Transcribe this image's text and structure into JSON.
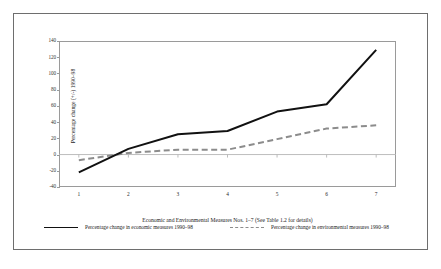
{
  "chart_data": {
    "type": "line",
    "title": "",
    "xlabel": "Economic and Environmental Measures Nos. 1–7 (See Table 1.2 for details)",
    "ylabel": "Percentage change (+/-) 1990–98",
    "x": [
      1,
      2,
      3,
      4,
      5,
      6,
      7
    ],
    "xticklabels": [
      "1",
      "2",
      "3",
      "4",
      "5",
      "6",
      "7"
    ],
    "yticklabels": [
      "140",
      "120",
      "100",
      "80",
      "60",
      "40",
      "20",
      "0",
      "-20",
      "-40"
    ],
    "yticks": [
      140,
      120,
      100,
      80,
      60,
      40,
      20,
      0,
      -20,
      -40
    ],
    "ylim": [
      -40,
      140
    ],
    "xlim": [
      0.6,
      7.4
    ],
    "grid": false,
    "legend_position": "bottom",
    "series": [
      {
        "name": "Percentage change in economic measures 1990–98",
        "values": [
          -22,
          7,
          25,
          29,
          53,
          62,
          129
        ],
        "style": "solid",
        "color": "#111111",
        "width": 2.0
      },
      {
        "name": "Percentage change in environmental measures 1990–98",
        "values": [
          -7,
          2,
          6,
          6,
          19,
          32,
          36
        ],
        "style": "dashed",
        "color": "#8c8c8c",
        "width": 2.0
      }
    ]
  },
  "legend": {
    "economic_label": "Percentage change in economic measures 1990–98",
    "environmental_label": "Percentage change in environmental measures 1990–98"
  }
}
